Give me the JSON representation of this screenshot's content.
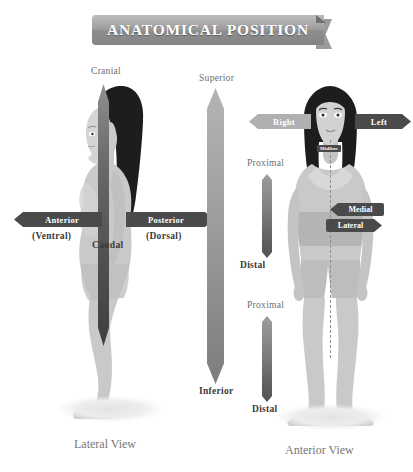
{
  "title": "ANATOMICAL POSITION",
  "lateral_figure": {
    "caption": "Lateral View",
    "cranial": "Cranial",
    "caudal": "Caudal",
    "anterior": "Anterior",
    "anterior_sub": "(Ventral)",
    "posterior": "Posterior",
    "posterior_sub": "(Dorsal)"
  },
  "center_axis": {
    "superior": "Superior",
    "inferior": "Inferior"
  },
  "anterior_figure": {
    "caption": "Anterior View",
    "right": "Right",
    "left": "Left",
    "midline": "Midline",
    "medial": "Medial",
    "lateral": "Lateral",
    "arm_proximal": "Proximal",
    "arm_distal": "Distal",
    "leg_proximal": "Proximal",
    "leg_distal": "Distal"
  },
  "colors": {
    "banner_gray": "#9a9a9a",
    "arrow_dark": "#4a4a4a",
    "arrow_mid": "#6f6f6f",
    "arrow_light": "#b0b0b0",
    "skin": "#c9c9c9",
    "hair": "#1d1d1d",
    "text_gray": "#6e6e6e",
    "background": "#ffffff"
  }
}
